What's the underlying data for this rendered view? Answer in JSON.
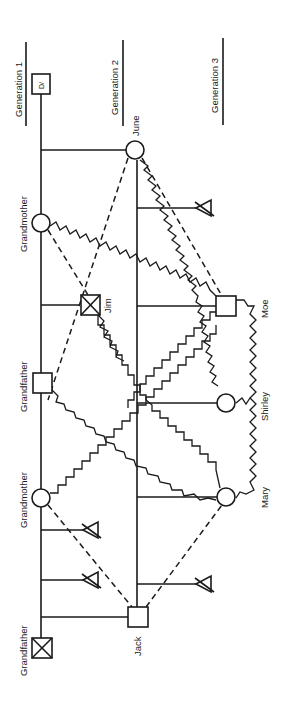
{
  "diagram": {
    "type": "genogram",
    "orientation": "rotated -90deg",
    "generations": [
      {
        "label": "Generation 1"
      },
      {
        "label": "Generation 2"
      },
      {
        "label": "Generation 3"
      }
    ],
    "people": {
      "divorced_marker": "D/",
      "june": "June",
      "grandmother_paternal": "Grandmother",
      "jim": "Jim",
      "grandfather_paternal": "Grandfather",
      "grandmother_maternal": "Grandmother",
      "jack": "Jack",
      "grandfather_maternal": "Grandfather",
      "moe": "Moe",
      "shirley": "Shirley",
      "mary": "Mary"
    },
    "legend_notes": {
      "square": "male",
      "circle": "female",
      "x_square": "deceased male",
      "triangle_struck": "miscarriage / pregnancy loss",
      "dashed_line": "distant relationship",
      "zigzag_line": "conflictual relationship"
    }
  }
}
